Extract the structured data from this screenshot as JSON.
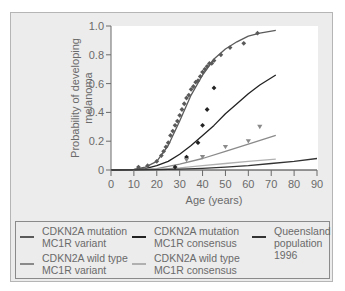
{
  "chart_data": {
    "type": "line",
    "title": "",
    "xlabel": "Age (years)",
    "ylabel": "Probability of developing melanoma",
    "xlim": [
      0,
      90
    ],
    "ylim": [
      0,
      1.0
    ],
    "x_ticks": [
      "0",
      "10",
      "20",
      "30",
      "40",
      "50",
      "60",
      "70",
      "80",
      "90"
    ],
    "y_ticks": [
      "0",
      "0.2",
      "0.4",
      "0.6",
      "0.8",
      "1.0"
    ],
    "grid": false,
    "legend_position": "bottom",
    "series": [
      {
        "name": "CDKN2A mutation MC1R variant",
        "color": "#5a5a5a",
        "curve": {
          "x": [
            0,
            10,
            15,
            20,
            25,
            30,
            35,
            40,
            45,
            50,
            55,
            60,
            65,
            72
          ],
          "y": [
            0,
            0.005,
            0.02,
            0.06,
            0.17,
            0.34,
            0.52,
            0.66,
            0.77,
            0.84,
            0.89,
            0.93,
            0.95,
            0.97
          ]
        },
        "points": {
          "marker": "diamond",
          "x": [
            12,
            16,
            20,
            22,
            23,
            24,
            25,
            26,
            27,
            28,
            29,
            30,
            31,
            32,
            33,
            34,
            35,
            36,
            37,
            38,
            39,
            40,
            41,
            42,
            43,
            44,
            45,
            48,
            52,
            58,
            64
          ],
          "y": [
            0.02,
            0.03,
            0.06,
            0.1,
            0.13,
            0.16,
            0.19,
            0.24,
            0.27,
            0.31,
            0.34,
            0.38,
            0.42,
            0.46,
            0.5,
            0.52,
            0.56,
            0.58,
            0.61,
            0.62,
            0.65,
            0.68,
            0.7,
            0.72,
            0.74,
            0.74,
            0.76,
            0.8,
            0.85,
            0.88,
            0.95
          ]
        }
      },
      {
        "name": "CDKN2A mutation MC1R consensus",
        "color": "#222222",
        "curve": {
          "x": [
            0,
            10,
            15,
            20,
            25,
            30,
            35,
            40,
            45,
            50,
            55,
            60,
            65,
            72
          ],
          "y": [
            0,
            0.003,
            0.01,
            0.03,
            0.06,
            0.11,
            0.17,
            0.24,
            0.31,
            0.39,
            0.46,
            0.53,
            0.59,
            0.66
          ]
        },
        "points": {
          "marker": "diamond",
          "x": [
            28,
            33,
            38,
            40,
            42,
            45
          ],
          "y": [
            0.02,
            0.09,
            0.19,
            0.31,
            0.42,
            0.57
          ]
        }
      },
      {
        "name": "CDKN2A wild type MC1R variant",
        "color": "#8a8a8a",
        "curve": {
          "x": [
            0,
            10,
            20,
            30,
            40,
            50,
            60,
            72
          ],
          "y": [
            0,
            0.002,
            0.01,
            0.04,
            0.08,
            0.13,
            0.18,
            0.24
          ]
        },
        "points": {
          "marker": "triangle",
          "x": [
            33,
            40,
            50,
            60,
            65
          ],
          "y": [
            0.07,
            0.09,
            0.16,
            0.2,
            0.3
          ]
        }
      },
      {
        "name": "CDKN2A wild type MC1R consensus",
        "color": "#b0b0b0",
        "curve": {
          "x": [
            0,
            10,
            20,
            30,
            40,
            50,
            60,
            72
          ],
          "y": [
            0,
            0.001,
            0.005,
            0.015,
            0.03,
            0.045,
            0.06,
            0.075
          ]
        },
        "points": {
          "marker": "none",
          "x": [],
          "y": []
        }
      },
      {
        "name": "Queensland population 1996",
        "color": "#333333",
        "curve": {
          "x": [
            0,
            10,
            20,
            30,
            40,
            50,
            60,
            70,
            80,
            90
          ],
          "y": [
            0,
            0.001,
            0.003,
            0.006,
            0.012,
            0.02,
            0.03,
            0.045,
            0.06,
            0.08
          ]
        },
        "points": {
          "marker": "none",
          "x": [],
          "y": []
        }
      }
    ]
  },
  "axes": {
    "xlabel": "Age (years)",
    "ylabel_line1": "Probability of developing",
    "ylabel_line2": "melanoma"
  },
  "legend": [
    {
      "label": "CDKN2A mutation\nMC1R variant",
      "color": "#5a5a5a"
    },
    {
      "label": "CDKN2A mutation\nMC1R consensus",
      "color": "#222222"
    },
    {
      "label": "Queensland\npopulation\n1996",
      "color": "#333333"
    },
    {
      "label": "CDKN2A wild type\nMC1R variant",
      "color": "#8a8a8a"
    },
    {
      "label": "CDKN2A wild type\nMC1R consensus",
      "color": "#b0b0b0"
    }
  ],
  "colors": {
    "panel_bg": "#ececec",
    "plot_bg": "#ffffff",
    "axis": "#6a6a6a",
    "text": "#6a6a6a"
  }
}
